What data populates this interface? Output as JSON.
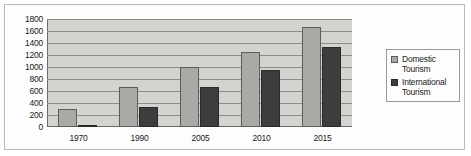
{
  "chart_data": {
    "type": "bar",
    "title": "",
    "xlabel": "",
    "ylabel": "",
    "categories": [
      "1970",
      "1990",
      "2005",
      "2010",
      "2015"
    ],
    "series": [
      {
        "name": "Domestic Tourism",
        "color": "#a9a9a5",
        "values": [
          300,
          670,
          1000,
          1250,
          1660
        ]
      },
      {
        "name": "International Tourism",
        "color": "#3d3d3d",
        "values": [
          30,
          340,
          660,
          945,
          1340
        ]
      }
    ],
    "ylim": [
      0,
      1800
    ],
    "ytick_step": 200,
    "yticks": [
      "1800",
      "1600",
      "1400",
      "1200",
      "1000",
      "800",
      "600",
      "400",
      "200",
      "0"
    ],
    "grid": true,
    "legend_position": "right",
    "plot_background": "#d3d3cf"
  },
  "legend": {
    "entries": [
      {
        "label_line1": "Domestic",
        "label_line2": "Tourism"
      },
      {
        "label_line1": "International",
        "label_line2": "Tourism"
      }
    ]
  }
}
